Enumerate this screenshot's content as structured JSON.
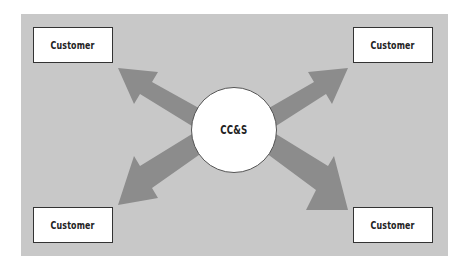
{
  "diagram": {
    "hub": {
      "label": "CC&S"
    },
    "nodes": [
      {
        "label": "Customer",
        "position": "top-left"
      },
      {
        "label": "Customer",
        "position": "top-right"
      },
      {
        "label": "Customer",
        "position": "bottom-left"
      },
      {
        "label": "Customer",
        "position": "bottom-right"
      }
    ],
    "edges": [
      {
        "from": "CC&S",
        "to": "Customer (top-left)",
        "type": "arrow"
      },
      {
        "from": "CC&S",
        "to": "Customer (top-right)",
        "type": "arrow"
      },
      {
        "from": "CC&S",
        "to": "Customer (bottom-left)",
        "type": "arrow"
      },
      {
        "from": "CC&S",
        "to": "Customer (bottom-right)",
        "type": "arrow"
      }
    ],
    "colors": {
      "background_panel": "#c8c8c8",
      "arrow": "#8c8c8c",
      "node_fill": "#ffffff",
      "node_border": "#333333"
    }
  }
}
